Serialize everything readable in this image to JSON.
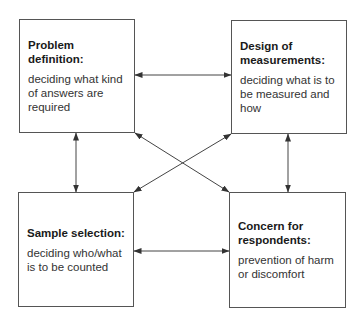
{
  "diagram": {
    "boxes": [
      {
        "id": "problem-definition",
        "title": "Problem definition:",
        "description": "deciding what kind of answers are required"
      },
      {
        "id": "design-of-measurements",
        "title": "Design of measurements:",
        "description": "deciding what is to be measured and how"
      },
      {
        "id": "sample-selection",
        "title": "Sample selection:",
        "description": "deciding who/what is to be counted"
      },
      {
        "id": "concern-for-respondents",
        "title": "Concern for respondents:",
        "description": "prevention of harm or discomfort"
      }
    ],
    "connections": [
      {
        "from": "problem-definition",
        "to": "design-of-measurements",
        "type": "bidirectional"
      },
      {
        "from": "problem-definition",
        "to": "sample-selection",
        "type": "bidirectional"
      },
      {
        "from": "design-of-measurements",
        "to": "concern-for-respondents",
        "type": "bidirectional"
      },
      {
        "from": "sample-selection",
        "to": "concern-for-respondents",
        "type": "bidirectional"
      },
      {
        "from": "problem-definition",
        "to": "concern-for-respondents",
        "type": "bidirectional"
      },
      {
        "from": "design-of-measurements",
        "to": "sample-selection",
        "type": "bidirectional"
      }
    ]
  }
}
